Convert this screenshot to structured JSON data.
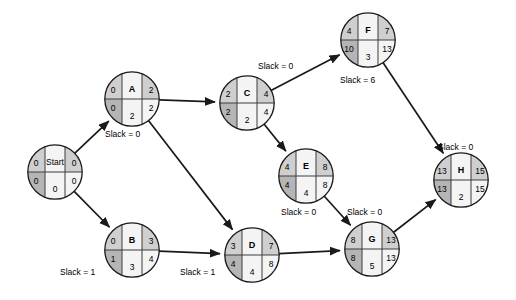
{
  "diagram": {
    "type": "activity-on-node-network",
    "colors": {
      "node_fill_light": "#cfcfcf",
      "node_fill_dark": "#b5b5b5",
      "node_fill_white": "#f4f4f4",
      "stroke": "#1a1a1a",
      "background": "#ffffff"
    },
    "nodes": [
      {
        "id": "start",
        "label": "Start",
        "es": "0",
        "ef": "0",
        "ls": "0",
        "lf": "0",
        "duration": "0",
        "slack": "",
        "cx": 55,
        "cy": 172
      },
      {
        "id": "a",
        "label": "A",
        "es": "0",
        "ef": "2",
        "ls": "0",
        "lf": "2",
        "duration": "2",
        "slack": "Slack = 0",
        "cx": 132,
        "cy": 99
      },
      {
        "id": "b",
        "label": "B",
        "es": "0",
        "ef": "3",
        "ls": "1",
        "lf": "4",
        "duration": "3",
        "slack": "Slack = 1",
        "cx": 132,
        "cy": 250
      },
      {
        "id": "c",
        "label": "C",
        "es": "2",
        "ef": "4",
        "ls": "2",
        "lf": "4",
        "duration": "2",
        "slack": "Slack = 0",
        "cx": 247,
        "cy": 103
      },
      {
        "id": "d",
        "label": "D",
        "es": "3",
        "ef": "7",
        "ls": "4",
        "lf": "8",
        "duration": "4",
        "slack": "Slack = 1",
        "cx": 252,
        "cy": 255
      },
      {
        "id": "e",
        "label": "E",
        "es": "4",
        "ef": "8",
        "ls": "4",
        "lf": "8",
        "duration": "4",
        "slack": "Slack = 0",
        "cx": 306,
        "cy": 176
      },
      {
        "id": "f",
        "label": "F",
        "es": "4",
        "ef": "7",
        "ls": "10",
        "lf": "13",
        "duration": "3",
        "slack": "Slack = 6",
        "cx": 368,
        "cy": 40
      },
      {
        "id": "g",
        "label": "G",
        "es": "8",
        "ef": "13",
        "ls": "8",
        "lf": "13",
        "duration": "5",
        "slack": "Slack = 0",
        "cx": 372,
        "cy": 249
      },
      {
        "id": "h",
        "label": "H",
        "es": "13",
        "ef": "15",
        "ls": "13",
        "lf": "15",
        "duration": "2",
        "slack": "Slack = 0",
        "cx": 461,
        "cy": 180
      }
    ],
    "slack_labels": [
      {
        "name": "slack-label-a",
        "text": "Slack = 0",
        "x": 105,
        "y": 130
      },
      {
        "name": "slack-label-c",
        "text": "Slack = 0",
        "x": 258,
        "y": 62
      },
      {
        "name": "slack-label-f",
        "text": "Slack = 6",
        "x": 340,
        "y": 76
      },
      {
        "name": "slack-label-e",
        "text": "Slack = 0",
        "x": 281,
        "y": 208
      },
      {
        "name": "slack-label-g",
        "text": "Slack = 0",
        "x": 347,
        "y": 208
      },
      {
        "name": "slack-label-h",
        "text": "Slack = 0",
        "x": 438,
        "y": 143
      },
      {
        "name": "slack-label-b",
        "text": "Slack = 1",
        "x": 60,
        "y": 268
      },
      {
        "name": "slack-label-d",
        "text": "Slack = 1",
        "x": 180,
        "y": 268
      }
    ],
    "edges": [
      {
        "from": "start",
        "to": "a"
      },
      {
        "from": "start",
        "to": "b"
      },
      {
        "from": "a",
        "to": "c"
      },
      {
        "from": "a",
        "to": "d"
      },
      {
        "from": "b",
        "to": "d"
      },
      {
        "from": "c",
        "to": "f"
      },
      {
        "from": "c",
        "to": "e"
      },
      {
        "from": "d",
        "to": "g"
      },
      {
        "from": "e",
        "to": "g"
      },
      {
        "from": "f",
        "to": "h"
      },
      {
        "from": "g",
        "to": "h"
      }
    ]
  }
}
